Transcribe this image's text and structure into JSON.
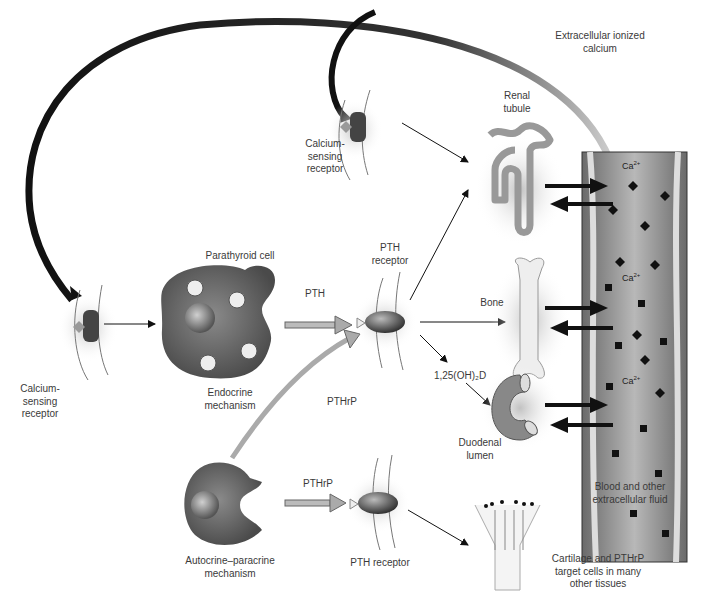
{
  "labels": {
    "extracellular_calcium": "Extracellular ionized\ncalcium",
    "renal_tubule": "Renal\ntubule",
    "csr_top": "Calcium-\nsensing\nreceptor",
    "csr_left": "Calcium-\nsensing\nreceptor",
    "parathyroid_cell": "Parathyroid cell",
    "endocrine": "Endocrine\nmechanism",
    "pth": "PTH",
    "pth_receptor_top": "PTH\nreceptor",
    "bone": "Bone",
    "vitd": "1,25(OH)₂D",
    "pthrp_diag": "PTHrP",
    "duodenal": "Duodenal\nlumen",
    "pthrp": "PTHrP",
    "autocrine": "Autocrine–paracrine\nmechanism",
    "pth_receptor_bottom": "PTH receptor",
    "blood": "Blood and other\nextracellular fluid",
    "cartilage": "Cartilage and PTHrP\ntarget cells in many\nother tissues",
    "ca_ion": "Ca",
    "ca_charge": "2+"
  },
  "colors": {
    "cell_dark": "#5a5a5a",
    "vessel": "#8a8a8a",
    "arrow": "#111111",
    "organ_light": "#d8d8d8"
  }
}
